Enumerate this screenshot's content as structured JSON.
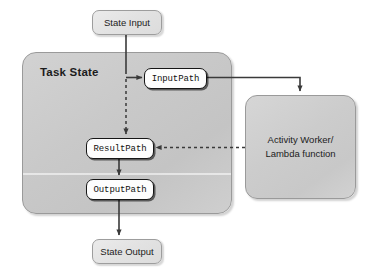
{
  "diagram": {
    "containers": {
      "task_state": {
        "label": "Task State"
      },
      "worker": {
        "line1": "Activity Worker/",
        "line2": "Lambda function"
      }
    },
    "terminals": {
      "state_input": "State Input",
      "state_output": "State Output"
    },
    "paths": {
      "input_path": "InputPath",
      "result_path": "ResultPath",
      "output_path": "OutputPath"
    },
    "colors": {
      "page_background": "#ffffff",
      "container_fill": "#cbcbcb",
      "container_border": "#9a9a9a",
      "terminal_fill": "#e4e4e4",
      "path_fill": "#fdfdfd",
      "path_border": "#161616",
      "connector": "#3a3a3a",
      "text": "#1c1c1c"
    },
    "connectors": [
      {
        "name": "state-input-to-junction",
        "style": "solid",
        "from": "State Input",
        "to": "Task State junction"
      },
      {
        "name": "junction-to-input-path",
        "style": "solid",
        "from": "junction",
        "to": "InputPath"
      },
      {
        "name": "junction-to-result-path",
        "style": "dashed",
        "from": "junction",
        "to": "ResultPath"
      },
      {
        "name": "input-path-to-worker",
        "style": "solid",
        "from": "InputPath",
        "to": "Activity Worker/Lambda function"
      },
      {
        "name": "worker-to-result-path",
        "style": "dashed",
        "from": "Activity Worker/Lambda function",
        "to": "ResultPath"
      },
      {
        "name": "result-path-to-output-path",
        "style": "solid",
        "from": "ResultPath",
        "to": "OutputPath"
      },
      {
        "name": "output-path-to-state-output",
        "style": "solid",
        "from": "OutputPath",
        "to": "State Output"
      }
    ]
  }
}
